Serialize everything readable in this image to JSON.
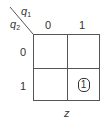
{
  "kmap": {
    "col_var": "q",
    "col_var_sub": "1",
    "row_var": "q",
    "row_var_sub": "2",
    "col_headers": [
      "0",
      "1"
    ],
    "row_headers": [
      "0",
      "1"
    ],
    "cells": [
      [
        "",
        ""
      ],
      [
        "",
        "1"
      ]
    ],
    "grouped_cells": [
      {
        "row": 1,
        "col": 1,
        "value": "1"
      }
    ],
    "output_label": "z"
  }
}
